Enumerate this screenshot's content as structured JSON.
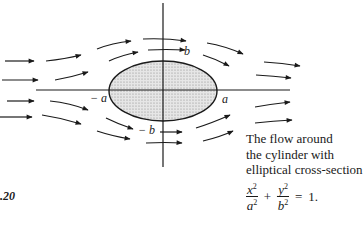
{
  "figure": {
    "number_label": ".20"
  },
  "axis_labels": {
    "neg_a": "− a",
    "pos_a": "a",
    "pos_b": "b",
    "neg_b": "− b"
  },
  "caption": {
    "lines": [
      "The flow around",
      "the cylinder with",
      "elliptical cross-section"
    ]
  },
  "equation": {
    "term1_num": "x",
    "term1_den": "a",
    "term2_num": "y",
    "term2_den": "b",
    "exponent": "2",
    "plus": "+",
    "equals": "=",
    "rhs": "1."
  },
  "ellipse": {
    "center_x": 163,
    "center_y": 91,
    "semi_a": 54,
    "semi_b": 30,
    "fill": "#d8d8d8",
    "stroke": "#1a1a1a"
  }
}
